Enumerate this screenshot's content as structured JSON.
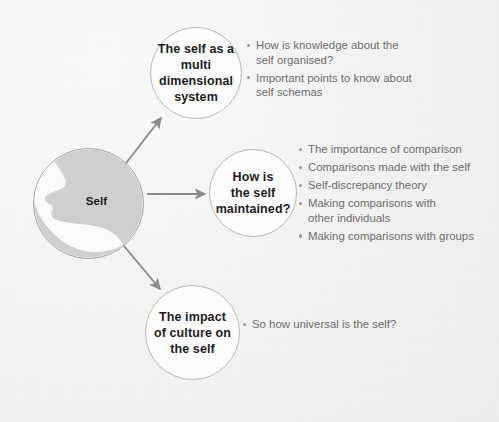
{
  "diagram": {
    "title_node": {
      "name": "Self",
      "label": "Self",
      "icon": "head-profile-silhouette"
    },
    "branches": [
      {
        "id": "multi-dimensional-system",
        "node_label": "The self as a\nmulti\ndimensional\nsystem",
        "bullets": [
          "How is knowledge about the\nself organised?",
          "Important points to know about\nself schemas"
        ]
      },
      {
        "id": "self-maintained",
        "node_label": "How is\nthe self\nmaintained?",
        "bullets": [
          "The importance of comparison",
          "Comparisons made with the self",
          "Self-discrepancy theory",
          "Making comparisons with\nother individuals",
          "Making comparisons with groups"
        ]
      },
      {
        "id": "impact-of-culture",
        "node_label": "The impact\nof culture on\nthe self",
        "bullets": [
          "So how universal is the self?"
        ]
      }
    ],
    "colors": {
      "background": "#f3f3f1",
      "node_border": "#b9b9b9",
      "node_fill": "#fdfdfc",
      "node_text": "#1c1c1c",
      "bullet_text": "#6d6d6d",
      "bullet_marker": "#9a9a9a",
      "arrow": "#8c8c8c",
      "silhouette": "#cfcfcf"
    }
  }
}
